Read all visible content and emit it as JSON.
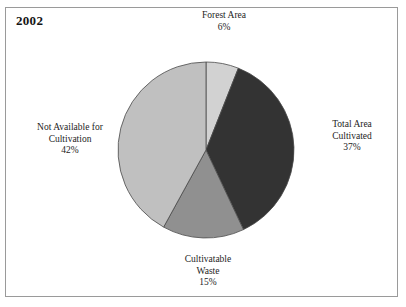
{
  "figure": {
    "year_title": "2002",
    "frame_color": "#9a9a9a",
    "background": "#ffffff"
  },
  "chart_data": {
    "type": "pie",
    "title": "2002",
    "xlabel": "",
    "ylabel": "",
    "legend_position": "none",
    "grid": false,
    "start_angle_deg": 0,
    "direction": "clockwise",
    "categories": [
      "Forest Area",
      "Total Area Cultivated",
      "Cultivatable Waste",
      "Not Available for Cultivation"
    ],
    "values": [
      6,
      37,
      15,
      42
    ],
    "value_unit": "%",
    "colors": [
      "#d2d2d2",
      "#333333",
      "#909090",
      "#c0c0c0"
    ],
    "slices": [
      {
        "name": "Forest Area",
        "label_line1": "Forest Area",
        "label_line2": "6%",
        "value": 6,
        "value_text": "6%",
        "color": "#d2d2d2"
      },
      {
        "name": "Total Area Cultivated",
        "label_line1": "Total Area",
        "label_line2": "Cultivated",
        "label_line3": "37%",
        "value": 37,
        "value_text": "37%",
        "color": "#333333"
      },
      {
        "name": "Cultivatable Waste",
        "label_line1": "Cultivatable",
        "label_line2": "Waste",
        "label_line3": "15%",
        "value": 15,
        "value_text": "15%",
        "color": "#909090"
      },
      {
        "name": "Not Available for Cultivation",
        "label_line1": "Not Available for",
        "label_line2": "Cultivation",
        "label_line3": "42%",
        "value": 42,
        "value_text": "42%",
        "color": "#c0c0c0"
      }
    ]
  }
}
